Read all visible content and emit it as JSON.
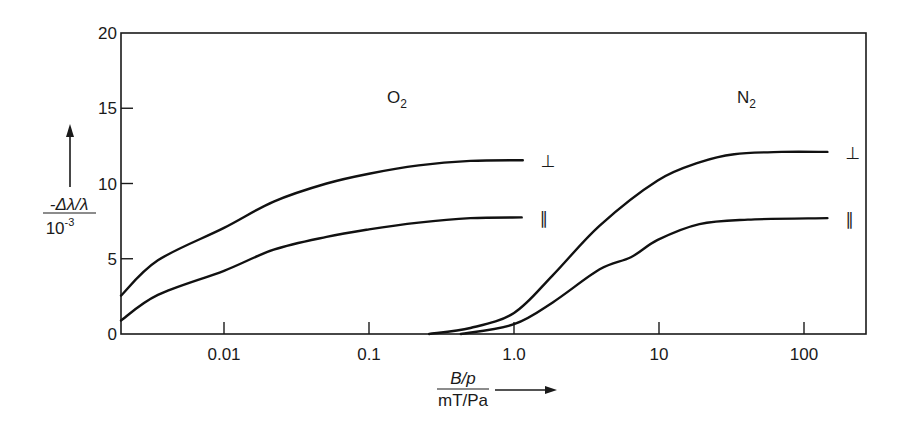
{
  "chart_data": {
    "type": "line",
    "title": "",
    "xlabel": "B/p / (mT/Pa)",
    "xlabel_numerator": "B/p",
    "xlabel_denominator": "mT/Pa",
    "ylabel": "-Δλ/λ / 10^-3",
    "ylabel_numerator": "-Δλ/λ",
    "ylabel_denominator_base": "10",
    "ylabel_denominator_exp": "-3",
    "x_scale": "log",
    "xlim": [
      0.0019,
      270
    ],
    "ylim": [
      0,
      20
    ],
    "grid": false,
    "legend": "inline labels",
    "x_ticks": [
      {
        "value": 0.01,
        "label": "0.01"
      },
      {
        "value": 0.1,
        "label": "0.1"
      },
      {
        "value": 1.0,
        "label": "1.0"
      },
      {
        "value": 10,
        "label": "10"
      },
      {
        "value": 100,
        "label": "100"
      }
    ],
    "y_ticks": [
      {
        "value": 0,
        "label": "0"
      },
      {
        "value": 5,
        "label": "5"
      },
      {
        "value": 10,
        "label": "10"
      },
      {
        "value": 15,
        "label": "15"
      },
      {
        "value": 20,
        "label": "20"
      }
    ],
    "annotations": [
      {
        "text": "O",
        "sub": "2",
        "x": 0.09,
        "y": 15.9
      },
      {
        "text": "N",
        "sub": "2",
        "x": 12.5,
        "y": 15.9
      }
    ],
    "series": [
      {
        "name": "O2 ⊥",
        "gas": "O2",
        "orientation": "⊥",
        "x": [
          0.0019,
          0.0035,
          0.01,
          0.022,
          0.051,
          0.1,
          0.22,
          0.5,
          1.15
        ],
        "y": [
          2.55,
          4.9,
          7.05,
          8.8,
          10.0,
          10.65,
          11.2,
          11.5,
          11.55
        ]
      },
      {
        "name": "O2 ∥",
        "gas": "O2",
        "orientation": "∥",
        "x": [
          0.0019,
          0.0035,
          0.01,
          0.022,
          0.051,
          0.1,
          0.22,
          0.5,
          1.13
        ],
        "y": [
          0.9,
          2.6,
          4.2,
          5.6,
          6.45,
          6.95,
          7.4,
          7.7,
          7.75
        ]
      },
      {
        "name": "N2 ⊥",
        "gas": "N2",
        "orientation": "⊥",
        "x": [
          0.26,
          0.5,
          1.0,
          1.85,
          3.9,
          9.8,
          19,
          33,
          70,
          145
        ],
        "y": [
          0.0,
          0.4,
          1.4,
          3.9,
          7.2,
          10.2,
          11.4,
          11.95,
          12.1,
          12.1
        ]
      },
      {
        "name": "N2 ∥",
        "gas": "N2",
        "orientation": "∥",
        "x": [
          0.43,
          1.0,
          1.85,
          3.9,
          6.4,
          9.8,
          19,
          41,
          145
        ],
        "y": [
          0.0,
          0.65,
          2.1,
          4.3,
          5.1,
          6.25,
          7.3,
          7.6,
          7.7
        ]
      }
    ],
    "end_labels": [
      {
        "series": 0,
        "text": "⊥"
      },
      {
        "series": 1,
        "text": "∥"
      },
      {
        "series": 2,
        "text": "⊥"
      },
      {
        "series": 3,
        "text": "∥"
      }
    ],
    "colors": {
      "line": "#111111",
      "text": "#1a1a1a",
      "background": "#ffffff"
    }
  }
}
